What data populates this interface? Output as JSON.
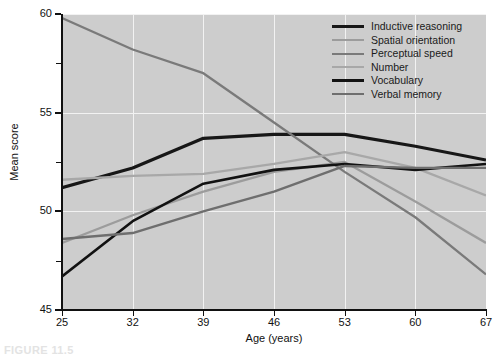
{
  "chart_data": {
    "type": "line",
    "title": "",
    "xlabel": "Age (years)",
    "ylabel": "Mean score",
    "x": [
      25,
      32,
      39,
      46,
      53,
      60,
      67
    ],
    "xtick_labels": [
      "25",
      "32",
      "39",
      "46",
      "53",
      "60",
      "67"
    ],
    "ytick_labels": [
      "45",
      "50",
      "55",
      "60"
    ],
    "ytick_values": [
      45,
      50,
      55,
      60
    ],
    "yminor_values": [
      47.5,
      52.5,
      57.5
    ],
    "xlim": [
      25,
      67
    ],
    "ylim": [
      45,
      60
    ],
    "grid": true,
    "grid_color": "#f2f2f2",
    "plot_background": "#cdcdcd",
    "legend_position": "top-right",
    "series": [
      {
        "name": "Inductive reasoning",
        "color": "#171717",
        "width": 3.2,
        "values": [
          51.2,
          52.2,
          53.7,
          53.9,
          53.9,
          53.3,
          52.6
        ]
      },
      {
        "name": "Spatial orientation",
        "color": "#9c9c9c",
        "width": 2.3,
        "values": [
          48.4,
          49.8,
          51.0,
          52.0,
          52.5,
          50.5,
          48.4
        ]
      },
      {
        "name": "Perceptual speed",
        "color": "#7a7a7a",
        "width": 2.3,
        "values": [
          59.8,
          58.2,
          57.0,
          54.5,
          52.0,
          49.7,
          46.8
        ]
      },
      {
        "name": "Number",
        "color": "#a8a8a8",
        "width": 2.3,
        "values": [
          51.6,
          51.8,
          51.9,
          52.4,
          53.0,
          52.2,
          50.8
        ]
      },
      {
        "name": "Vocabulary",
        "color": "#121212",
        "width": 2.6,
        "values": [
          46.7,
          49.5,
          51.4,
          52.1,
          52.4,
          52.1,
          52.4
        ]
      },
      {
        "name": "Verbal memory",
        "color": "#6e6e6e",
        "width": 2.4,
        "values": [
          48.6,
          48.9,
          50.0,
          51.0,
          52.3,
          52.2,
          52.2
        ]
      }
    ]
  },
  "caption": "FIGURE 11.5"
}
